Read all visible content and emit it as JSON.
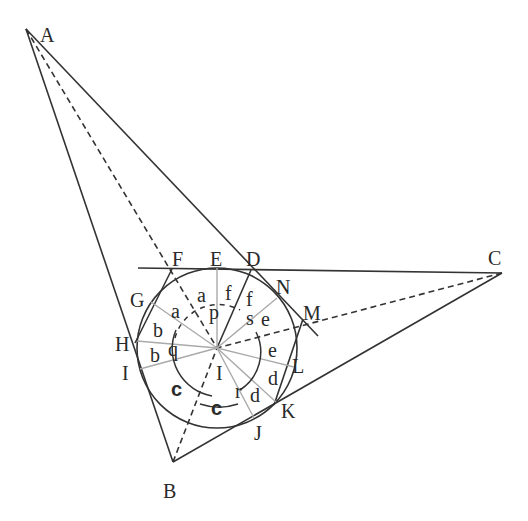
{
  "figure": {
    "points": [
      {
        "label": "A",
        "x": 26,
        "y": 29,
        "lx": 40,
        "ly": 42
      },
      {
        "label": "B",
        "x": 173,
        "y": 462,
        "lx": 163,
        "ly": 498
      },
      {
        "label": "C",
        "x": 502,
        "y": 273,
        "lx": 488,
        "ly": 265
      },
      {
        "label": "D",
        "x": 251,
        "y": 270,
        "lx": 246,
        "ly": 266
      },
      {
        "label": "E",
        "x": 217,
        "y": 269,
        "lx": 210,
        "ly": 266
      },
      {
        "label": "F",
        "x": 172,
        "y": 269,
        "lx": 172,
        "ly": 266
      },
      {
        "label": "G",
        "x": 151,
        "y": 301,
        "lx": 130,
        "ly": 307
      },
      {
        "label": "H",
        "x": 136,
        "y": 342,
        "lx": 115,
        "ly": 351
      },
      {
        "label": "I",
        "x": 217,
        "y": 348,
        "lx": 216,
        "ly": 380
      },
      {
        "label": "J",
        "x": 254,
        "y": 418,
        "lx": 254,
        "ly": 440
      },
      {
        "label": "K",
        "x": 274,
        "y": 404,
        "lx": 281,
        "ly": 418
      },
      {
        "label": "L",
        "x": 291,
        "y": 367,
        "lx": 292,
        "ly": 373
      },
      {
        "label": "M",
        "x": 303,
        "y": 317,
        "lx": 303,
        "ly": 320
      },
      {
        "label": "N",
        "x": 277,
        "y": 298,
        "lx": 276,
        "ly": 294
      },
      {
        "label": "I",
        "x": 136,
        "y": 367,
        "lx": 122,
        "ly": 380
      }
    ],
    "angle_labels": [
      {
        "text": "a",
        "x": 197,
        "y": 302,
        "bold": false
      },
      {
        "text": "a",
        "x": 171,
        "y": 318,
        "bold": false
      },
      {
        "text": "f",
        "x": 225,
        "y": 300,
        "bold": false
      },
      {
        "text": "f",
        "x": 246,
        "y": 306,
        "bold": false
      },
      {
        "text": "p",
        "x": 209,
        "y": 319,
        "bold": false
      },
      {
        "text": "s",
        "x": 246,
        "y": 325,
        "bold": false
      },
      {
        "text": "e",
        "x": 261,
        "y": 326,
        "bold": false
      },
      {
        "text": "e",
        "x": 268,
        "y": 357,
        "bold": false
      },
      {
        "text": "b",
        "x": 153,
        "y": 337,
        "bold": false
      },
      {
        "text": "b",
        "x": 150,
        "y": 362,
        "bold": false
      },
      {
        "text": "q",
        "x": 168,
        "y": 356,
        "bold": false
      },
      {
        "text": "d",
        "x": 268,
        "y": 385,
        "bold": false
      },
      {
        "text": "d",
        "x": 250,
        "y": 402,
        "bold": false
      },
      {
        "text": "r",
        "x": 235,
        "y": 398,
        "bold": false
      },
      {
        "text": "c",
        "x": 171,
        "y": 396,
        "bold": true
      },
      {
        "text": "c",
        "x": 211,
        "y": 415,
        "bold": true
      }
    ],
    "incircle": {
      "cx": 217,
      "cy": 348,
      "r": 80
    }
  }
}
